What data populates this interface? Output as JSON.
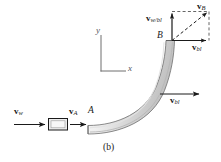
{
  "figure": {
    "caption": "(b)",
    "axes": {
      "x_label": "x",
      "y_label": "y"
    },
    "points": {
      "A": "A",
      "B": "B"
    },
    "vectors": {
      "v_w": {
        "symbol": "v",
        "subscript": "w"
      },
      "v_A": {
        "symbol": "v",
        "subscript": "A"
      },
      "v_bl_lower": {
        "symbol": "v",
        "subscript": "bl"
      },
      "v_bl_upper": {
        "symbol": "v",
        "subscript": "bl"
      },
      "v_w_bl": {
        "symbol": "v",
        "subscript": "w/bl"
      },
      "v_B": {
        "symbol": "v",
        "subscript": "B"
      }
    },
    "colors": {
      "ink": "#1a1a1a",
      "blade_fill_light": "#f0f0f0",
      "blade_fill_dark": "#c9c9c9",
      "nozzle_fill": "#ededed",
      "axis": "#707070",
      "dashed": "#444444"
    }
  }
}
